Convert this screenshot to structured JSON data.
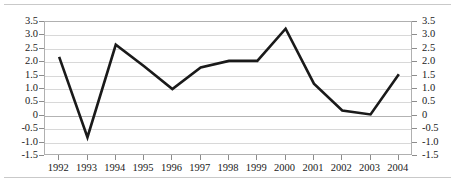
{
  "chart_data": {
    "type": "line",
    "title": "",
    "subtitle": "",
    "xlabel": "",
    "ylabel": "",
    "categories": [
      "1992",
      "1993",
      "1994",
      "1995",
      "1996",
      "1997",
      "1998",
      "1999",
      "2000",
      "2001",
      "2002",
      "2003",
      "2004"
    ],
    "values": [
      2.2,
      -0.8,
      2.65,
      1.85,
      1.0,
      1.8,
      2.05,
      2.05,
      3.25,
      1.2,
      0.2,
      0.05,
      1.55
    ],
    "series": [
      {
        "name": "",
        "values": [
          2.2,
          -0.8,
          2.65,
          1.85,
          1.0,
          1.8,
          2.05,
          2.05,
          3.25,
          1.2,
          0.2,
          0.05,
          1.55
        ]
      }
    ],
    "ylim": [
      -1.5,
      3.5
    ],
    "yticks": [
      3.5,
      3.0,
      2.5,
      2.0,
      1.5,
      1.0,
      0.5,
      0,
      -0.5,
      -1.0,
      -1.5
    ],
    "ytick_labels": [
      "3.5",
      "3.0",
      "2.5",
      "2.0",
      "1.5",
      "1.0",
      "0.5",
      "0",
      "-0.5",
      "-1.0",
      "-1.5"
    ],
    "xtick_labels": [
      "1992",
      "1993",
      "1994",
      "1995",
      "1996",
      "1997",
      "1998",
      "1999",
      "2000",
      "2001",
      "2002",
      "2003",
      "2004"
    ],
    "grid": true,
    "legend": "none",
    "dual_y_axis": true,
    "line_color": "#1a1a1a",
    "grid_color": "#d8d8d8",
    "zero_line_color": "#b3b3b3",
    "axis_color": "#b0b0b0",
    "background_color": "#ffffff",
    "annotations": []
  },
  "axis": {
    "left_labels": [
      "3.5",
      "3.0",
      "2.5",
      "2.0",
      "1.5",
      "1.0",
      "0.5",
      "0",
      "-0.5",
      "-1.0",
      "-1.5"
    ],
    "right_labels": [
      "3.5",
      "3.0",
      "2.5",
      "2.0",
      "1.5",
      "1.0",
      "0.5",
      "0",
      "-0.5",
      "-1.0",
      "-1.5"
    ],
    "bottom_labels": [
      "1992",
      "1993",
      "1994",
      "1995",
      "1996",
      "1997",
      "1998",
      "1999",
      "2000",
      "2001",
      "2002",
      "2003",
      "2004"
    ]
  }
}
